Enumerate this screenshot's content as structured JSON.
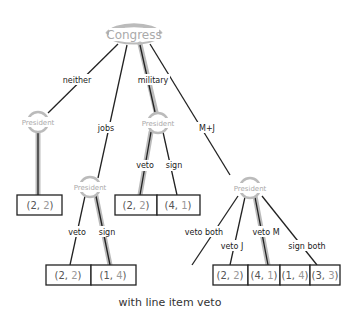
{
  "diagram": {
    "caption": "with line item veto",
    "root": {
      "label": "Congress"
    },
    "nodes": {
      "p_neither": "President",
      "p_jobs": "President",
      "p_military": "President",
      "p_mj": "President"
    },
    "edges": {
      "neither": "neither",
      "jobs": "jobs",
      "military": "military",
      "mj": "M+J",
      "mil_veto": "veto",
      "mil_sign": "sign",
      "jobs_veto": "veto",
      "jobs_sign": "sign",
      "mj_veto_both": "veto both",
      "mj_veto_j": "veto J",
      "mj_veto_m": "veto M",
      "mj_sign_both": "sign both"
    },
    "payoffs": {
      "neither": [
        "2",
        "2"
      ],
      "mil_veto": [
        "2",
        "2"
      ],
      "mil_sign": [
        "4",
        "1"
      ],
      "jobs_veto": [
        "2",
        "2"
      ],
      "jobs_sign": [
        "1",
        "4"
      ],
      "mj_veto_both": [
        "2",
        "2"
      ],
      "mj_veto_j": [
        "4",
        "1"
      ],
      "mj_veto_m": [
        "1",
        "4"
      ],
      "mj_sign_both": [
        "3",
        "3"
      ]
    },
    "colors": {
      "line": "#222222",
      "highlight": "#aaaaaa",
      "node_text": "#aaaaaa"
    }
  }
}
